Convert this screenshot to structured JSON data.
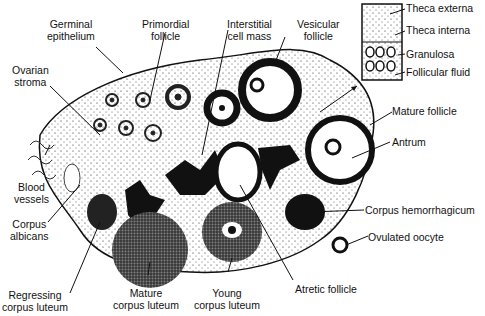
{
  "labels": {
    "germinal_epithelium": [
      "Germinal",
      "epithelium"
    ],
    "primordial_follicle": [
      "Primordial",
      "follicle"
    ],
    "interstitial_cell_mass": [
      "Interstitial",
      "cell mass"
    ],
    "vesicular_follicle": [
      "Vesicular",
      "follicle"
    ],
    "ovarian_stroma": [
      "Ovarian",
      "stroma"
    ],
    "blood_vessels": [
      "Blood",
      "vessels"
    ],
    "corpus_albicans": [
      "Corpus",
      "albicans"
    ],
    "regressing_corpus_luteum": [
      "Regressing",
      "corpus luteum"
    ],
    "mature_corpus_luteum": [
      "Mature",
      "corpus luteum"
    ],
    "young_corpus_luteum": [
      "Young",
      "corpus luteum"
    ],
    "atretic_follicle": "Atretic follicle",
    "mature_follicle": "Mature follicle",
    "antrum": "Antrum",
    "corpus_hemorrhagicum": "Corpus hemorrhagicum",
    "ovulated_oocyte": "Ovulated oocyte"
  },
  "inset": {
    "theca_externa": "Theca externa",
    "theca_interna": "Theca interna",
    "granulosa": "Granulosa",
    "follicular_fluid": "Follicular fluid"
  }
}
